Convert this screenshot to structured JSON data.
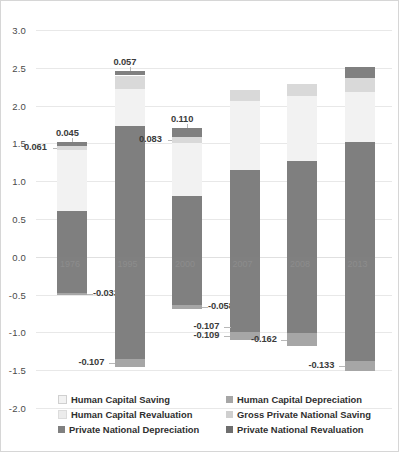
{
  "chart_data": {
    "type": "bar",
    "subtype": "stacked-bar-positive-negative",
    "title": "",
    "xlabel": "",
    "ylabel": "",
    "ylim": [
      -2.0,
      3.0
    ],
    "ytick_step": 0.5,
    "yticks": [
      "3.0",
      "2.5",
      "2.0",
      "1.5",
      "1.0",
      "0.5",
      "0.0",
      "-0.5",
      "-1.0",
      "-1.5",
      "-2.0"
    ],
    "grid": true,
    "legend_position": "bottom",
    "categories": [
      "1976",
      "1995",
      "2000",
      "2007",
      "2008",
      "2013"
    ],
    "series": [
      {
        "name": "Gross Private National Saving",
        "color": "#7f7f7f",
        "values": [
          0.609,
          1.734,
          0.81,
          1.153,
          1.269,
          1.521
        ],
        "labels": [
          "0.609",
          "1.734",
          "0.810",
          "1.153",
          "1.269",
          "1.521"
        ]
      },
      {
        "name": "Human Capital Saving",
        "color": "#f2f2f2",
        "values": [
          0.798,
          0.492,
          0.695,
          0.912,
          0.856,
          0.665
        ],
        "labels": [
          "0.798",
          "0.492",
          "0.695",
          "0.912",
          "0.856",
          "0.665"
        ]
      },
      {
        "name": "Human Capital Revaluation",
        "color": "#d9d9d9",
        "values": [
          0.061,
          0.172,
          0.083,
          0.146,
          0.158,
          0.182
        ],
        "labels": [
          "0.061",
          "0.172",
          "0.083",
          "0.146",
          "0.158",
          "0.182"
        ]
      },
      {
        "name": "Private National Revaluation",
        "color": "#808080",
        "values": [
          0.045,
          0.057,
          0.11,
          0.0,
          0.0,
          0.147
        ],
        "labels": [
          "0.045",
          "0.057",
          "0.110",
          "",
          "",
          "0.147"
        ]
      },
      {
        "name": "Private National Depreciation",
        "color": "#808080",
        "values": [
          -0.479,
          -1.348,
          -0.639,
          -0.994,
          -1.013,
          -1.382
        ],
        "labels": [
          "-0.479",
          "-1.348",
          "-0.639",
          "-0.994",
          "-1.013",
          "-1.382"
        ]
      },
      {
        "name": "Human Capital Depreciation",
        "color": "#a6a6a6",
        "values": [
          -0.033,
          -0.107,
          -0.058,
          -0.109,
          -0.162,
          -0.133
        ],
        "labels": [
          "-0.033",
          "-0.107",
          "-0.058",
          "-0.109",
          "-0.162",
          "-0.133"
        ]
      }
    ],
    "extra_callouts": [
      {
        "category": "2007",
        "text": "-0.107",
        "note": "upper-left callout near 2007 negative tail"
      }
    ]
  },
  "legend": {
    "items": [
      {
        "label": "Human Capital Saving",
        "color": "#f2f2f2"
      },
      {
        "label": "Human Capital Depreciation",
        "color": "#a6a6a6"
      },
      {
        "label": "Human Capital Revaluation",
        "color": "#d9d9d9"
      },
      {
        "label": "Gross Private National Saving",
        "color": "#bfbfbf"
      },
      {
        "label": "Private National Depreciation",
        "color": "#808080"
      },
      {
        "label": "Private National Revaluation",
        "color": "#595959"
      }
    ]
  },
  "axis": {
    "y_labels": [
      "3.0",
      "2.5",
      "2.0",
      "1.5",
      "1.0",
      "0.5",
      "0.0",
      "-0.5",
      "-1.0",
      "-1.5",
      "-2.0"
    ]
  },
  "year_labels": [
    "1976",
    "1995",
    "2000",
    "2007",
    "2008",
    "2013"
  ]
}
